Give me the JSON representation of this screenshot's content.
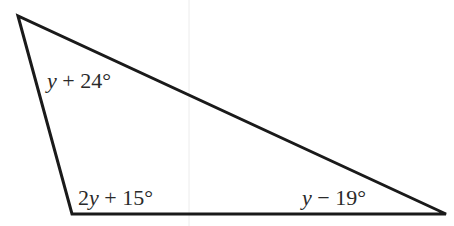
{
  "diagram": {
    "type": "triangle",
    "stroke_color": "#1a1a1a",
    "guide_color": "#ececec",
    "vertices": {
      "top_left": [
        18,
        16
      ],
      "bottom_left": [
        72,
        214
      ],
      "bottom_right": [
        446,
        214
      ]
    },
    "angles": {
      "top_left": {
        "coef": "",
        "var": "y",
        "rest": " + 24°",
        "full": "y + 24°"
      },
      "bottom_left": {
        "coef": "2",
        "var": "y",
        "rest": " + 15°",
        "full": "2y + 15°"
      },
      "bottom_right": {
        "coef": "",
        "var": "y",
        "rest": " − 19°",
        "full": "y − 19°"
      }
    }
  }
}
